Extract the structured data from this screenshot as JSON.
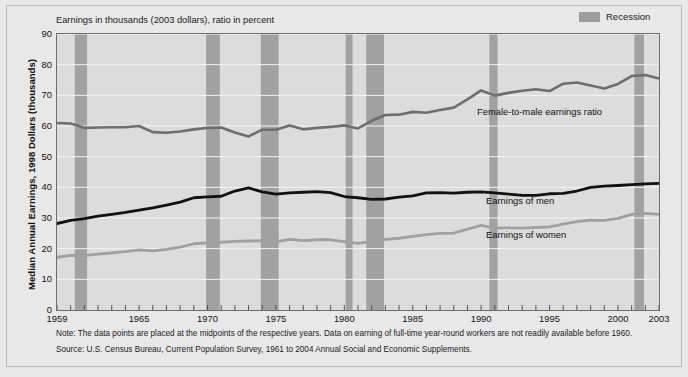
{
  "legend": {
    "recession_label": "Recession",
    "recession_color": "#9d9d9d"
  },
  "y_axis": {
    "title": "Median Annual Earnings, 1998 Dollars (thousands)",
    "ticks": [
      0,
      10,
      20,
      30,
      40,
      50,
      60,
      70,
      80,
      90
    ],
    "min": 0,
    "max": 90
  },
  "x_axis": {
    "ticks": [
      1959,
      1965,
      1970,
      1975,
      1980,
      1985,
      1990,
      1995,
      2000,
      2003
    ],
    "min": 1959,
    "max": 2003
  },
  "units_caption": "Earnings in thousands (2003 dollars), ratio in percent",
  "annotations": {
    "ratio": "Female-to-male earnings ratio",
    "men": "Earnings of men",
    "women": "Earnings of women"
  },
  "footnotes": {
    "note": "Note: The data points are placed at the midpoints of the respective years. Data on earning of full-time year-round workers are not readily available before 1960.",
    "source": "Source: U.S. Census Bureau, Current Population Survey, 1961 to 2004 Annual Social and Economic Supplements."
  },
  "chart_data": {
    "type": "line",
    "title": "",
    "subtitle": "Earnings in thousands (2003 dollars), ratio in percent",
    "xlabel": "",
    "ylabel": "Median Annual Earnings, 1998 Dollars (thousands)",
    "xlim": [
      1959,
      2003
    ],
    "ylim": [
      0,
      90
    ],
    "grid": true,
    "legend_position": "top-right",
    "plot_background": "#dcdcdc",
    "x": [
      1959,
      1960,
      1961,
      1962,
      1963,
      1964,
      1965,
      1966,
      1967,
      1968,
      1969,
      1970,
      1971,
      1972,
      1973,
      1974,
      1975,
      1976,
      1977,
      1978,
      1979,
      1980,
      1981,
      1982,
      1983,
      1984,
      1985,
      1986,
      1987,
      1988,
      1989,
      1990,
      1991,
      1992,
      1993,
      1994,
      1995,
      1996,
      1997,
      1998,
      1999,
      2000,
      2001,
      2002,
      2003
    ],
    "series": [
      {
        "name": "Female-to-male earnings ratio",
        "color": "#6e6e6e",
        "width": 2.6,
        "unit": "percent",
        "values": [
          61.0,
          60.8,
          59.4,
          59.5,
          59.6,
          59.6,
          60.0,
          58.0,
          57.8,
          58.2,
          58.9,
          59.4,
          59.5,
          57.9,
          56.6,
          58.8,
          58.8,
          60.2,
          58.9,
          59.4,
          59.7,
          60.2,
          59.2,
          61.7,
          63.6,
          63.7,
          64.6,
          64.3,
          65.2,
          66.0,
          68.7,
          71.6,
          69.9,
          70.8,
          71.5,
          72.0,
          71.4,
          73.8,
          74.2,
          73.2,
          72.2,
          73.7,
          76.3,
          76.6,
          75.5
        ]
      },
      {
        "name": "Earnings of men",
        "color": "#111111",
        "width": 2.8,
        "unit": "thousands of 2003 dollars",
        "values": [
          28.2,
          29.2,
          29.8,
          30.6,
          31.2,
          31.8,
          32.6,
          33.3,
          34.2,
          35.2,
          36.6,
          36.9,
          37.1,
          38.8,
          39.8,
          38.5,
          37.8,
          38.2,
          38.4,
          38.6,
          38.3,
          37.0,
          36.6,
          36.1,
          36.2,
          36.8,
          37.2,
          38.2,
          38.3,
          38.1,
          38.4,
          38.5,
          38.2,
          37.8,
          37.4,
          37.4,
          37.9,
          38.0,
          38.8,
          40.0,
          40.4,
          40.6,
          40.9,
          41.1,
          41.3
        ]
      },
      {
        "name": "Earnings of women",
        "color": "#a0a0a0",
        "width": 2.8,
        "unit": "thousands of 2003 dollars",
        "values": [
          17.2,
          17.8,
          17.7,
          18.2,
          18.6,
          19.0,
          19.6,
          19.3,
          19.8,
          20.5,
          21.6,
          21.9,
          22.1,
          22.4,
          22.5,
          22.6,
          22.2,
          23.0,
          22.6,
          22.9,
          22.9,
          22.3,
          21.7,
          22.3,
          23.0,
          23.4,
          24.0,
          24.6,
          25.0,
          25.1,
          26.4,
          27.6,
          26.7,
          26.8,
          26.7,
          26.9,
          27.1,
          28.0,
          28.8,
          29.3,
          29.2,
          29.9,
          31.2,
          31.5,
          31.2
        ]
      }
    ],
    "recession_bands": [
      {
        "start": 1960.3,
        "end": 1961.2
      },
      {
        "start": 1969.9,
        "end": 1970.9
      },
      {
        "start": 1973.9,
        "end": 1975.2
      },
      {
        "start": 1980.1,
        "end": 1980.6
      },
      {
        "start": 1981.6,
        "end": 1982.9
      },
      {
        "start": 1990.6,
        "end": 1991.2
      },
      {
        "start": 2001.2,
        "end": 2001.9
      }
    ]
  }
}
